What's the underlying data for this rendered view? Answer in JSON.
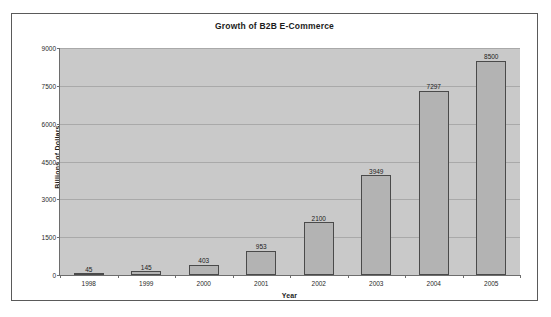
{
  "chart_data": {
    "type": "bar",
    "title": "Growth of B2B E-Commerce",
    "xlabel": "Year",
    "ylabel": "Billions of Dollars",
    "categories": [
      "1998",
      "1999",
      "2000",
      "2001",
      "2002",
      "2003",
      "2004",
      "2005"
    ],
    "values": [
      45,
      145,
      403,
      953,
      2100,
      3949,
      7297,
      8500
    ],
    "data_labels": [
      "45",
      "145",
      "403",
      "953",
      "2100",
      "3949",
      "7297",
      "8500"
    ],
    "ylim": [
      0,
      9000
    ],
    "ytick_values": [
      0,
      1500,
      3000,
      4500,
      6000,
      7500,
      9000
    ],
    "ytick_labels": [
      "0",
      "1500",
      "3000",
      "4500",
      "6000",
      "7500",
      "9000"
    ],
    "grid": true,
    "legend": false,
    "colors": {
      "bar_fill": "#b3b3b3",
      "bar_border": "#4a4a4a",
      "plot_background": "#c9c9c9",
      "gridline": "#a9a9a9",
      "axis": "#6d6d6d",
      "text": "#1c1c1c",
      "page_background": "#ffffff",
      "frame_border": "#5a5a5a"
    }
  }
}
